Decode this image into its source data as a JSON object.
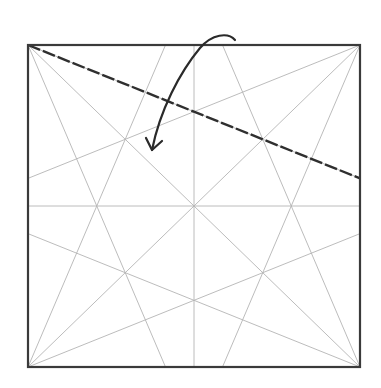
{
  "diagram": {
    "paper": "square",
    "crease_pattern": {
      "description": "Precreased square: both diagonals, both midlines, and 22.5° lines from every corner",
      "ratio_points": [
        0.4142,
        0.5,
        0.5858
      ]
    },
    "fold_line": {
      "type": "valley-fold",
      "from": "top-left corner",
      "to": "right edge at 0.4142 of height"
    },
    "arrow": {
      "meaning": "fold flap down and over",
      "direction": "from top-center right, curving down-left"
    },
    "colors": {
      "edge": "#3a3a3a",
      "crease": "#b4b4b4",
      "fold": "#2f2f2f",
      "arrow": "#2a2a2a"
    }
  }
}
